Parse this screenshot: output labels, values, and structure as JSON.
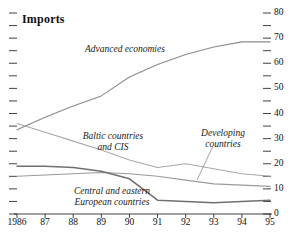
{
  "chart_data": {
    "type": "line",
    "title": "Imports",
    "xlabel": "",
    "ylabel": "",
    "x": [
      1986,
      1987,
      1988,
      1989,
      1990,
      1991,
      1992,
      1993,
      1994,
      1995
    ],
    "xtick_labels": [
      "1986",
      "87",
      "88",
      "89",
      "90",
      "91",
      "92",
      "93",
      "94",
      "95"
    ],
    "ylim": [
      0,
      80
    ],
    "ytick_labels": [
      "0",
      "10",
      "20",
      "30",
      "40",
      "50",
      "60",
      "70",
      "80"
    ],
    "ytick_values": [
      0,
      10,
      20,
      30,
      40,
      50,
      60,
      70,
      80
    ],
    "yminor_values": [
      5,
      15,
      25,
      35,
      45,
      55,
      65,
      75
    ],
    "y_axis_position": "right",
    "grid": false,
    "legend": "inline-annotations",
    "series": [
      {
        "name": "Advanced economies",
        "color": "#8a8a8a",
        "values": [
          33.5,
          38.5,
          43.0,
          47.0,
          54.5,
          59.5,
          63.5,
          66.5,
          68.5,
          68.5
        ]
      },
      {
        "name": "Baltic countries and CIS",
        "color": "#a8a8a8",
        "values": [
          36.0,
          32.5,
          29.0,
          25.5,
          21.5,
          18.5,
          20.0,
          18.0,
          16.0,
          15.0
        ]
      },
      {
        "name": "Developing countries",
        "color": "#9a9a9a",
        "values": [
          15.0,
          15.5,
          16.0,
          16.5,
          16.0,
          15.0,
          13.5,
          12.0,
          11.5,
          11.0
        ]
      },
      {
        "name": "Central and eastern European countries",
        "color": "#707070",
        "values": [
          19.0,
          19.0,
          18.5,
          17.0,
          14.0,
          5.5,
          5.0,
          4.5,
          5.0,
          5.5
        ]
      }
    ],
    "annotations": [
      {
        "text": "Advanced economies",
        "style": "italic"
      },
      {
        "text": "Baltic countries",
        "style": "italic"
      },
      {
        "text": "and CIS",
        "style": "italic"
      },
      {
        "text": "Developing",
        "style": "italic"
      },
      {
        "text": "countries",
        "style": "italic"
      },
      {
        "text": "Central and eastern",
        "style": "italic"
      },
      {
        "text": "European countries",
        "style": "italic"
      }
    ]
  },
  "labels": {
    "title": "Imports",
    "advanced": "Advanced economies",
    "baltic_line1": "Baltic countries",
    "baltic_line2": "and CIS",
    "developing_line1": "Developing",
    "developing_line2": "countries",
    "cee_line1": "Central and eastern",
    "cee_line2": "European countries"
  },
  "axes": {
    "y_right": [
      "80",
      "70",
      "60",
      "50",
      "40",
      "30",
      "20",
      "10",
      "0"
    ],
    "x": [
      "1986",
      "87",
      "88",
      "89",
      "90",
      "91",
      "92",
      "93",
      "94",
      "95"
    ]
  },
  "colors": {
    "axis": "#2b2b2b",
    "text": "#111111",
    "advanced": "#8a8a8a",
    "baltic": "#a8a8a8",
    "developing": "#9a9a9a",
    "cee": "#707070",
    "background": "#ffffff"
  }
}
